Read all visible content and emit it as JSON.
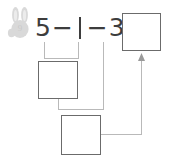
{
  "page": {
    "background_color": "#ffffff"
  },
  "badge": {
    "icon": "bunny-icon",
    "number": "9",
    "color": "#d8d8d8",
    "number_color": "#c9c9c9"
  },
  "equation": {
    "full_text": "5 − | − 3 =",
    "tokens": [
      {
        "type": "number",
        "text": "5"
      },
      {
        "type": "operator",
        "text": "−"
      },
      {
        "type": "cursor",
        "text": "|"
      },
      {
        "type": "operator",
        "text": "−"
      },
      {
        "type": "number",
        "text": "3"
      },
      {
        "type": "equals",
        "text": "="
      }
    ],
    "minuend": "5",
    "subtrahend": "3",
    "text_color": "#3d3d3d"
  },
  "boxes": [
    {
      "id": "box-result",
      "name": "answer-box-result",
      "value": "",
      "placeholder": ""
    },
    {
      "id": "box-part-a",
      "name": "answer-box-part-a",
      "value": "",
      "placeholder": ""
    },
    {
      "id": "box-part-b",
      "name": "answer-box-part-b",
      "value": "",
      "placeholder": ""
    }
  ],
  "connectors": {
    "line_color": "#b9b9b9",
    "box_border_color": "#6b6b6b",
    "arrow_color": "#9a9a9a",
    "items": [
      {
        "name": "bracket-five-to-part-a",
        "from": "equation-five",
        "to": "box-part-a"
      },
      {
        "name": "drop-line-from-three",
        "from": "equation-three",
        "to": "elbow-junction"
      },
      {
        "name": "elbow-part-a-to-drop",
        "from": "box-part-a",
        "to": "drop-line-from-three"
      },
      {
        "name": "arrow-part-b-to-result",
        "from": "box-part-b",
        "to": "box-result",
        "has_arrowhead": true
      }
    ]
  }
}
